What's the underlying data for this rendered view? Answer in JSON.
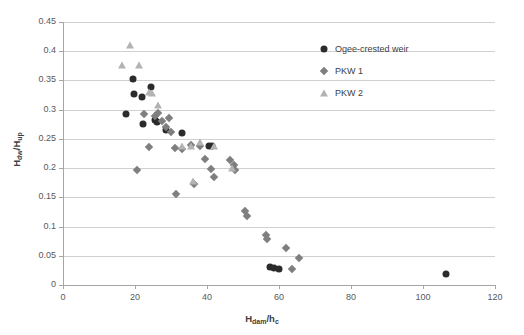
{
  "chart_data": {
    "type": "scatter",
    "title": "",
    "xlabel": "Hdam/hc",
    "xlabel_parts": {
      "main1": "H",
      "sub1": "dam",
      "slash": "/h",
      "sub2": "c"
    },
    "ylabel": "Hdw/Hup",
    "ylabel_parts": {
      "main1": "H",
      "sub1": "dw",
      "slash": "/H",
      "sub2": "up"
    },
    "xlim": [
      0,
      120
    ],
    "ylim": [
      0,
      0.45
    ],
    "xticks": [
      0,
      20,
      40,
      60,
      80,
      100,
      120
    ],
    "yticks": [
      0,
      0.05,
      0.1,
      0.15,
      0.2,
      0.25,
      0.3,
      0.35,
      0.4,
      0.45
    ],
    "ytick_labels": [
      "0",
      "0.05",
      "0.1",
      "0.15",
      "0.2",
      "0.25",
      "0.3",
      "0.35",
      "0.4",
      "0.45"
    ],
    "xtick_labels": [
      "0",
      "20",
      "40",
      "60",
      "80",
      "100",
      "120"
    ],
    "grid": "horizontal",
    "legend_position": "top-right",
    "colors": {
      "ogee": "#2b2b2b",
      "pkw1": "#7f7f7f",
      "pkw2": "#b3b3b3",
      "gridline": "#d0d0d0",
      "axis": "#a6a6a6",
      "text": "#595959"
    },
    "series": [
      {
        "name": "Ogee-crested weir",
        "marker": "circle",
        "color": "#2b2b2b",
        "points": [
          [
            17.5,
            0.293
          ],
          [
            19.5,
            0.353
          ],
          [
            19.8,
            0.327
          ],
          [
            22.0,
            0.322
          ],
          [
            22.3,
            0.275
          ],
          [
            24.5,
            0.338
          ],
          [
            25.5,
            0.283
          ],
          [
            26.0,
            0.279
          ],
          [
            28.5,
            0.266
          ],
          [
            33.0,
            0.26
          ],
          [
            40.5,
            0.238
          ],
          [
            41.5,
            0.237
          ],
          [
            57.5,
            0.03
          ],
          [
            58.5,
            0.029
          ],
          [
            60.0,
            0.028
          ],
          [
            106.5,
            0.018
          ]
        ]
      },
      {
        "name": "PKW 1",
        "marker": "diamond",
        "color": "#7f7f7f",
        "points": [
          [
            20.5,
            0.196
          ],
          [
            22.5,
            0.292
          ],
          [
            24.0,
            0.236
          ],
          [
            25.5,
            0.289
          ],
          [
            26.5,
            0.294
          ],
          [
            27.5,
            0.281
          ],
          [
            28.5,
            0.27
          ],
          [
            29.5,
            0.286
          ],
          [
            30.0,
            0.262
          ],
          [
            31.0,
            0.234
          ],
          [
            31.5,
            0.155
          ],
          [
            33.0,
            0.233
          ],
          [
            35.5,
            0.239
          ],
          [
            36.5,
            0.173
          ],
          [
            38.0,
            0.238
          ],
          [
            39.5,
            0.215
          ],
          [
            41.0,
            0.198
          ],
          [
            42.0,
            0.185
          ],
          [
            46.5,
            0.214
          ],
          [
            47.5,
            0.205
          ],
          [
            47.8,
            0.196
          ],
          [
            50.5,
            0.127
          ],
          [
            51.0,
            0.118
          ],
          [
            56.5,
            0.086
          ],
          [
            56.8,
            0.079
          ],
          [
            62.0,
            0.063
          ],
          [
            63.5,
            0.028
          ],
          [
            65.5,
            0.046
          ]
        ]
      },
      {
        "name": "PKW 2",
        "marker": "triangle",
        "color": "#b3b3b3",
        "points": [
          [
            16.5,
            0.377
          ],
          [
            18.5,
            0.411
          ],
          [
            21.0,
            0.376
          ],
          [
            24.0,
            0.33
          ],
          [
            24.8,
            0.329
          ],
          [
            26.5,
            0.308
          ],
          [
            33.0,
            0.237
          ],
          [
            35.5,
            0.237
          ],
          [
            38.0,
            0.245
          ],
          [
            36.0,
            0.178
          ],
          [
            42.0,
            0.237
          ],
          [
            47.0,
            0.2
          ]
        ]
      }
    ]
  },
  "legend": {
    "items": [
      {
        "label": "Ogee-crested weir",
        "marker": "circle"
      },
      {
        "label": "PKW 1",
        "marker": "diamond"
      },
      {
        "label": "PKW 2",
        "marker": "triangle"
      }
    ]
  }
}
